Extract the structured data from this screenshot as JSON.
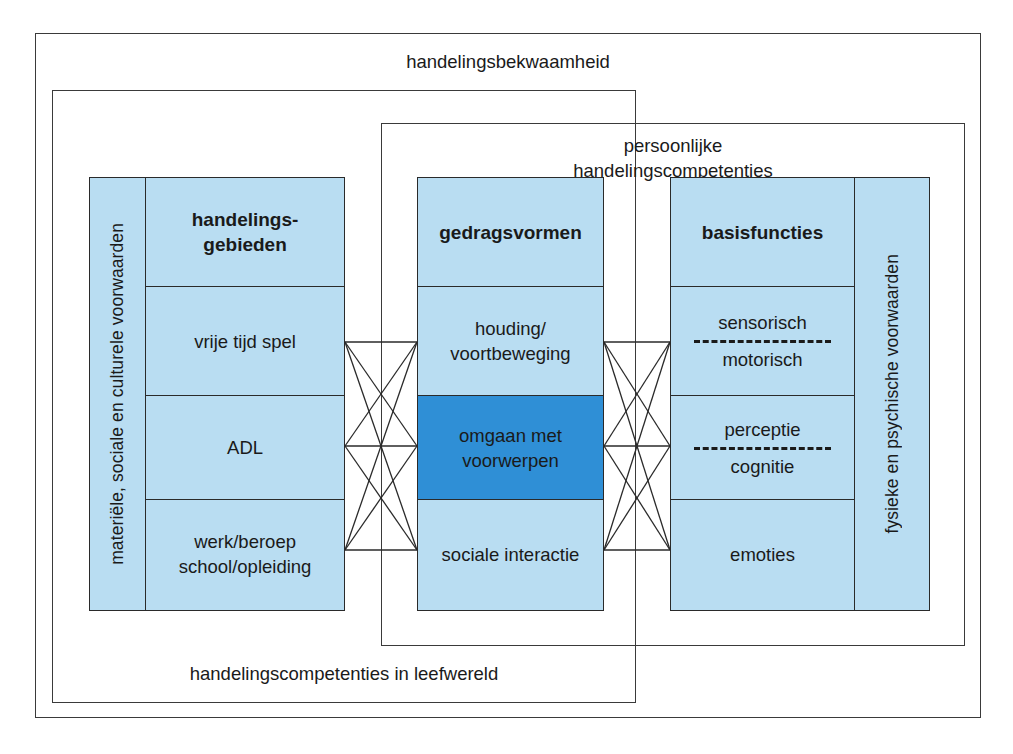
{
  "diagram": {
    "title": "handelingsbekwaamheid",
    "frames": [
      {
        "name": "handelingsbekwaamheid",
        "label": "handelingsbekwaamheid"
      },
      {
        "name": "handelingscompetenties-in-leefwereld",
        "label": "handelingscompetenties in leefwereld"
      },
      {
        "name": "persoonlijke-handelingscompetenties",
        "label": "persoonlijke\nhandelingscompetenties"
      }
    ],
    "left_group": {
      "sidebar_label": "materiële, sociale en culturele voorwaarden",
      "header": "handelings-\ngebieden",
      "cells": [
        {
          "label": "vrije tijd\nspel"
        },
        {
          "label": "ADL"
        },
        {
          "label": "werk/beroep\nschool/opleiding"
        }
      ]
    },
    "middle_group": {
      "header": "gedragsvormen",
      "cells": [
        {
          "label": "houding/\nvoortbeweging",
          "highlighted": false
        },
        {
          "label": "omgaan met\nvoorwerpen",
          "highlighted": true
        },
        {
          "label": "sociale interactie",
          "highlighted": false
        }
      ]
    },
    "right_group": {
      "sidebar_label": "fysieke en psychische voorwaarden",
      "header": "basisfuncties",
      "cells": [
        {
          "top": "sensorisch",
          "bottom": "motorisch",
          "divider": "dashed"
        },
        {
          "top": "perceptie",
          "bottom": "cognitie",
          "divider": "dashed"
        },
        {
          "top": "emoties",
          "bottom": "",
          "divider": "none"
        }
      ]
    },
    "colors": {
      "panel_fill": "#b9ddf2",
      "highlight_fill": "#2f8fd6",
      "line": "#2a2a2a",
      "frame_line": "#3a3a3a",
      "text": "#1a1a1a",
      "page_background": "#ffffff"
    }
  }
}
